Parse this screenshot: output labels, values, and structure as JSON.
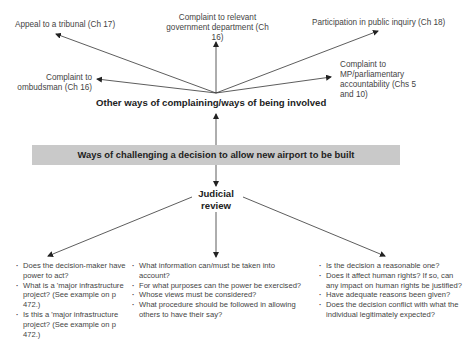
{
  "diagram": {
    "center": {
      "title": "Ways of challenging a decision to allow new airport to be built"
    },
    "other_ways": {
      "heading": "Other ways of complaining/ways of being involved",
      "branches": [
        {
          "id": "tribunal",
          "label": "Appeal to a tribunal (Ch 17)"
        },
        {
          "id": "government",
          "label_lines": [
            "Complaint to relevant",
            "government department (Ch 16)"
          ]
        },
        {
          "id": "inquiry",
          "label": "Participation in public inquiry (Ch 18)"
        },
        {
          "id": "ombudsman",
          "label_lines": [
            "Complaint to",
            "ombudsman (Ch 16)"
          ]
        },
        {
          "id": "mp",
          "label_lines": [
            "Complaint to",
            "MP/parliamentary",
            "accountability  (Chs 5",
            "and 10)"
          ]
        }
      ]
    },
    "judicial_review": {
      "heading_lines": [
        "Judicial",
        "review"
      ],
      "groups": [
        {
          "id": "legality",
          "items": [
            "Does the decision-maker have power to act?",
            "What is a 'major infrastructure project? (See example on p 472.)",
            "Is this a 'major infrastructure project? (See example on p 472.)"
          ]
        },
        {
          "id": "procedure",
          "items": [
            "What information can/must be taken into account?",
            "For what purposes can the power be exercised?",
            "Whose views must be considered?",
            "What procedure should be followed in allowing others to have their say?"
          ]
        },
        {
          "id": "rationality",
          "items": [
            "Is the decision a reasonable one?",
            "Does it affect human rights? If so, can any impact on human rights be justified?",
            "Have adequate reasons been given?",
            "Does the decision conflict with what the individual legitimately expected?"
          ]
        }
      ]
    }
  }
}
